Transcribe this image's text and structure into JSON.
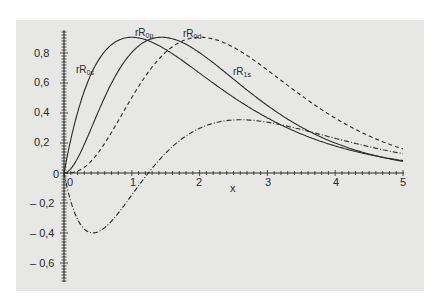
{
  "chart_data": {
    "type": "line",
    "title": "",
    "xlabel": "x",
    "ylabel": "",
    "xlim": [
      0,
      5
    ],
    "ylim": [
      -0.72,
      0.95
    ],
    "grid": false,
    "legend_position": "inline labels on curves",
    "x_ticks": [
      "0",
      "1",
      "2",
      "3",
      "4",
      "5"
    ],
    "y_ticks": [
      "-0,6",
      "-0,4",
      "-0,2",
      "0",
      "0,2",
      "0,4",
      "0,6",
      "0,8"
    ],
    "origin_labels": {
      "x": "0",
      "y": "0"
    },
    "series": [
      {
        "name": "rR0s",
        "label_main": "rR",
        "label_sub": "0s",
        "style": "solid",
        "x": [
          0,
          0.25,
          0.5,
          0.75,
          1.0,
          1.25,
          1.5,
          2.0,
          2.5,
          3.0,
          3.5,
          4.0,
          4.5,
          5.0
        ],
        "values": [
          0,
          0.39,
          0.66,
          0.83,
          0.9,
          0.87,
          0.78,
          0.54,
          0.32,
          0.17,
          0.08,
          0.03,
          0.01,
          0.0
        ]
      },
      {
        "name": "rR0p",
        "label_main": "rR",
        "label_sub": "0p",
        "style": "solid",
        "x": [
          0,
          0.25,
          0.5,
          0.75,
          1.0,
          1.25,
          1.5,
          2.0,
          2.5,
          3.0,
          3.5,
          4.0,
          4.5,
          5.0
        ],
        "values": [
          0,
          0.07,
          0.25,
          0.5,
          0.73,
          0.87,
          0.9,
          0.78,
          0.54,
          0.32,
          0.17,
          0.08,
          0.03,
          0.01
        ]
      },
      {
        "name": "rR0d",
        "label_main": "rR",
        "label_sub": "0d",
        "style": "dashed",
        "x": [
          0,
          0.25,
          0.5,
          0.75,
          1.0,
          1.25,
          1.5,
          2.0,
          2.5,
          3.0,
          3.5,
          4.0,
          4.5,
          5.0
        ],
        "values": [
          0,
          0.01,
          0.06,
          0.18,
          0.36,
          0.56,
          0.72,
          0.9,
          0.81,
          0.58,
          0.36,
          0.19,
          0.09,
          0.04
        ]
      },
      {
        "name": "rR1s",
        "label_main": "rR",
        "label_sub": "1s",
        "style": "dash-dot",
        "x": [
          0,
          0.25,
          0.5,
          0.75,
          1.0,
          1.25,
          1.5,
          2.0,
          2.5,
          3.0,
          3.5,
          4.0,
          4.5,
          5.0
        ],
        "values": [
          0,
          -0.38,
          -0.63,
          -0.68,
          -0.44,
          -0.02,
          0.39,
          0.82,
          0.74,
          0.52,
          0.31,
          0.15,
          0.06,
          0.02
        ]
      }
    ]
  },
  "labels": {
    "x_axis": "x",
    "x_ticks": [
      "0",
      "1",
      "2",
      "3",
      "4",
      "5"
    ],
    "y_ticks_pos": [
      "0,2",
      "0,4",
      "0,6",
      "0,8"
    ],
    "y_ticks_neg": [
      "– 0,2",
      "– 0,4",
      "– 0,6"
    ],
    "origin_y": "0",
    "series_labels": [
      {
        "main": "rR",
        "sub": "0s"
      },
      {
        "main": "rR",
        "sub": "0p"
      },
      {
        "main": "rR",
        "sub": "0d"
      },
      {
        "main": "rR",
        "sub": "1s"
      }
    ]
  },
  "colors": {
    "panel": "#e7e7e5",
    "ink": "#2a2a2a"
  }
}
